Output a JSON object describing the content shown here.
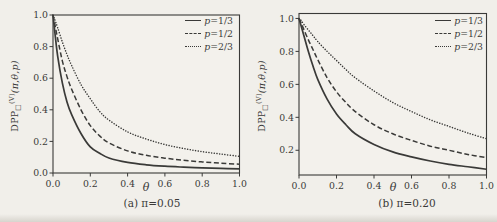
{
  "page": {
    "background": "#f1efea",
    "ink": "#3a3a38"
  },
  "figure": {
    "ylabel": {
      "base": "DPP",
      "sub": "□",
      "sup": "(V)",
      "args": "(π,θ,p)"
    },
    "legend": [
      {
        "style": "solid",
        "var": "p",
        "eq": "=1/3",
        "label": "p=1/3"
      },
      {
        "style": "dashed",
        "var": "p",
        "eq": "=1/2",
        "label": "p=1/2"
      },
      {
        "style": "dotted",
        "var": "p",
        "eq": "=2/3",
        "label": "p=2/3"
      }
    ]
  },
  "chart_data": [
    {
      "id": "a",
      "type": "line",
      "caption": "(a) π=0.05",
      "xlabel": "θ",
      "ylabel": "DPP□^(V)(π,θ,p)",
      "pi": 0.05,
      "xlim": [
        0,
        1
      ],
      "ylim": [
        0,
        1
      ],
      "grid": false,
      "legend_position": "top-right",
      "xtick_values": [
        0,
        0.2,
        0.4,
        0.6,
        0.8,
        1
      ],
      "xtick_labels": [
        "0.0",
        "0.2",
        "0.4",
        "0.6",
        "0.8",
        "1.0"
      ],
      "ytick_values": [
        0,
        0.2,
        0.4,
        0.6,
        0.8,
        1
      ],
      "ytick_labels": [
        "0.0",
        "0.2",
        "0.4",
        "0.6",
        "0.8",
        "1.0"
      ],
      "x": [
        0,
        0.01,
        0.025,
        0.05,
        0.075,
        0.1,
        0.15,
        0.2,
        0.25,
        0.3,
        0.4,
        0.5,
        0.6,
        0.7,
        0.8,
        0.9,
        1
      ],
      "series": [
        {
          "name": "p=1/3",
          "style": "solid",
          "values": [
            1,
            0.89,
            0.74,
            0.57,
            0.45,
            0.37,
            0.25,
            0.165,
            0.125,
            0.095,
            0.067,
            0.052,
            0.043,
            0.037,
            0.032,
            0.029,
            0.026
          ]
        },
        {
          "name": "p=1/2",
          "style": "dashed",
          "values": [
            1,
            0.94,
            0.85,
            0.71,
            0.61,
            0.53,
            0.4,
            0.3,
            0.235,
            0.19,
            0.14,
            0.112,
            0.094,
            0.081,
            0.07,
            0.062,
            0.056
          ]
        },
        {
          "name": "p=2/3",
          "style": "dotted",
          "values": [
            1,
            0.97,
            0.92,
            0.83,
            0.75,
            0.68,
            0.56,
            0.47,
            0.39,
            0.335,
            0.26,
            0.215,
            0.18,
            0.155,
            0.135,
            0.12,
            0.105
          ]
        }
      ]
    },
    {
      "id": "b",
      "type": "line",
      "caption": "(b) π=0.20",
      "xlabel": "θ",
      "ylabel": "DPP□^(V)(π,θ,p)",
      "pi": 0.2,
      "xlim": [
        0,
        1
      ],
      "ylim": [
        0.05,
        1.03
      ],
      "grid": false,
      "legend_position": "top-right",
      "xtick_values": [
        0,
        0.2,
        0.4,
        0.6,
        0.8,
        1
      ],
      "xtick_labels": [
        "0.0",
        "0.2",
        "0.4",
        "0.6",
        "0.8",
        "1.0"
      ],
      "ytick_values": [
        0.2,
        0.4,
        0.6,
        0.8,
        1
      ],
      "ytick_labels": [
        "0.2",
        "0.4",
        "0.6",
        "0.8",
        "1.0"
      ],
      "x": [
        0,
        0.01,
        0.025,
        0.05,
        0.075,
        0.1,
        0.15,
        0.2,
        0.25,
        0.3,
        0.4,
        0.5,
        0.6,
        0.7,
        0.8,
        0.9,
        1
      ],
      "series": [
        {
          "name": "p=1/3",
          "style": "solid",
          "values": [
            1,
            0.96,
            0.9,
            0.8,
            0.71,
            0.63,
            0.51,
            0.42,
            0.355,
            0.3,
            0.235,
            0.19,
            0.16,
            0.135,
            0.115,
            0.1,
            0.085
          ]
        },
        {
          "name": "p=1/2",
          "style": "dashed",
          "values": [
            1,
            0.975,
            0.935,
            0.87,
            0.81,
            0.75,
            0.64,
            0.555,
            0.49,
            0.435,
            0.355,
            0.3,
            0.26,
            0.225,
            0.2,
            0.175,
            0.155
          ]
        },
        {
          "name": "p=2/3",
          "style": "dotted",
          "values": [
            1,
            0.99,
            0.965,
            0.93,
            0.895,
            0.86,
            0.8,
            0.745,
            0.69,
            0.64,
            0.56,
            0.49,
            0.435,
            0.385,
            0.345,
            0.305,
            0.27
          ]
        }
      ]
    }
  ]
}
